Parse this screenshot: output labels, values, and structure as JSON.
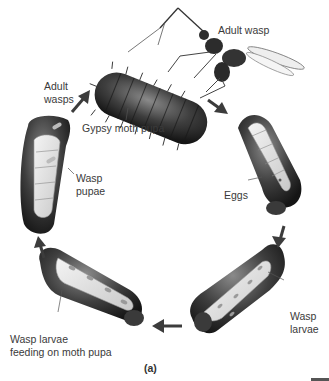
{
  "figure": {
    "caption": "(a)"
  },
  "labels": {
    "adult_wasp": "Adult wasp",
    "adult_wasps_line1": "Adult",
    "adult_wasps_line2": "wasps",
    "gypsy_moth_pupa": "Gypsy moth pupa",
    "wasp_pupae_line1": "Wasp",
    "wasp_pupae_line2": "pupae",
    "eggs": "Eggs",
    "wasp_larvae_line1": "Wasp",
    "wasp_larvae_line2": "larvae",
    "feeding_line1": "Wasp larvae",
    "feeding_line2": "feeding on moth pupa"
  },
  "cycle": [
    {
      "stage": "Gypsy moth pupa",
      "with": "Adult wasp"
    },
    {
      "stage": "Eggs"
    },
    {
      "stage": "Wasp larvae"
    },
    {
      "stage": "Wasp larvae feeding on moth pupa"
    },
    {
      "stage": "Wasp pupae"
    },
    {
      "stage": "Adult wasps"
    }
  ],
  "colors": {
    "pupa_dark": "#2a2a2a",
    "pupa_mid": "#6a6a6a",
    "interior": "#e8e8e8",
    "arrow": "#3c3c3c"
  }
}
